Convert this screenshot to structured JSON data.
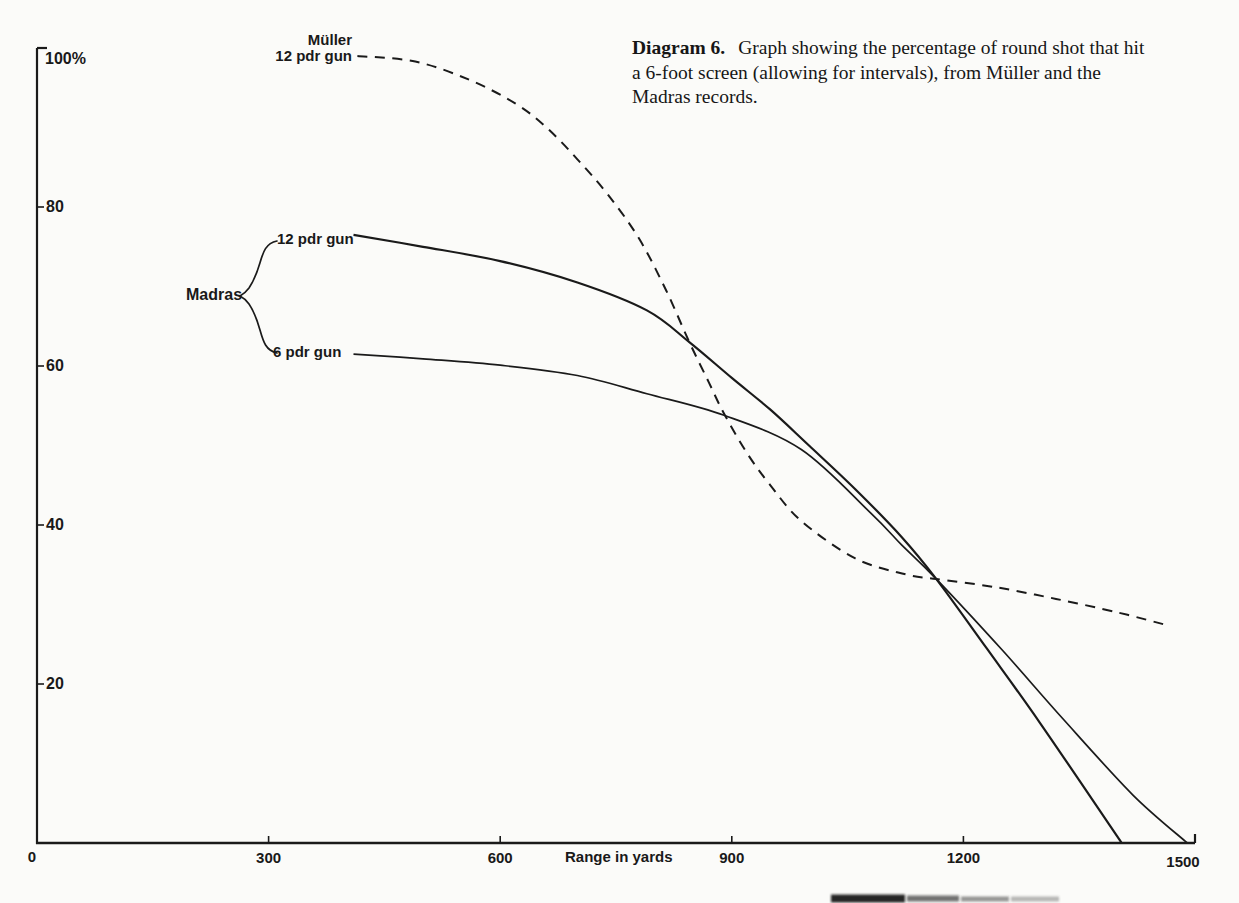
{
  "page": {
    "paper_color": "#fbfbf9",
    "ink_color": "#1a1a1a"
  },
  "caption": {
    "heading": "Diagram 6.",
    "body": "Graph showing the percentage of round shot that hit a 6-foot screen (allowing for intervals), from Müller and the Madras records."
  },
  "chart_data": {
    "type": "line",
    "xlabel": "Range in yards",
    "ylabel": "%",
    "xlim": [
      0,
      1500
    ],
    "ylim": [
      0,
      100
    ],
    "grid": false,
    "x_ticks": [
      {
        "value": 0,
        "label": "0"
      },
      {
        "value": 300,
        "label": "300"
      },
      {
        "value": 600,
        "label": "600"
      },
      {
        "value": 900,
        "label": "900"
      },
      {
        "value": 1200,
        "label": "1200"
      },
      {
        "value": 1500,
        "label": "1500"
      }
    ],
    "y_ticks": [
      {
        "value": 20,
        "label": "20"
      },
      {
        "value": 40,
        "label": "40"
      },
      {
        "value": 60,
        "label": "60"
      },
      {
        "value": 80,
        "label": "80"
      },
      {
        "value": 100,
        "label": "100%"
      }
    ],
    "series": [
      {
        "name": "Müller 12 pdr gun",
        "style": "dashed",
        "x": [
          415,
          490,
          560,
          620,
          660,
          700,
          740,
          780,
          815,
          845,
          870,
          890,
          920,
          950,
          990,
          1060,
          1125,
          1165,
          1240,
          1320,
          1400,
          1460
        ],
        "y": [
          99,
          98.3,
          96,
          93,
          90,
          86,
          81.5,
          76,
          69.5,
          63,
          58,
          54,
          49,
          45,
          40.5,
          35.8,
          33.8,
          33.2,
          32.2,
          30.7,
          29,
          27.5
        ]
      },
      {
        "name": "Madras 12 pdr gun",
        "style": "solid",
        "x": [
          410,
          500,
          600,
          700,
          790,
          845,
          900,
          950,
          1000,
          1060,
          1120,
          1165,
          1230,
          1300,
          1405
        ],
        "y": [
          76.5,
          75,
          73.2,
          70.5,
          67,
          63,
          58.5,
          54.5,
          50,
          44.5,
          38.5,
          33.2,
          24.5,
          15,
          0
        ]
      },
      {
        "name": "Madras 6 pdr gun",
        "style": "solid",
        "x": [
          410,
          500,
          600,
          700,
          790,
          890,
          990,
          1080,
          1120,
          1165,
          1250,
          1330,
          1420,
          1490
        ],
        "y": [
          61.5,
          60.9,
          60.1,
          58.8,
          56.5,
          53.8,
          49.5,
          41.5,
          37.5,
          33.2,
          24.3,
          15.5,
          6,
          0
        ]
      }
    ],
    "annotations": {
      "muller": {
        "line1": "Müller",
        "line2": "12 pdr gun"
      },
      "madras": {
        "group": "Madras",
        "gun12": "12 pdr gun",
        "gun6": "6 pdr gun"
      }
    },
    "crossing_point": {
      "x": 1165,
      "y": 33
    }
  }
}
